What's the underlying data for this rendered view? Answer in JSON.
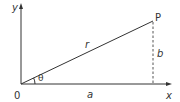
{
  "diagram": {
    "labels": {
      "y_axis": "y",
      "x_axis": "x",
      "origin": "0",
      "point": "P",
      "hypotenuse": "r",
      "adjacent": "a",
      "opposite": "b",
      "angle": "θ"
    },
    "colors": {
      "line": "#333333",
      "dashed": "#555555",
      "background": "#ffffff"
    }
  }
}
